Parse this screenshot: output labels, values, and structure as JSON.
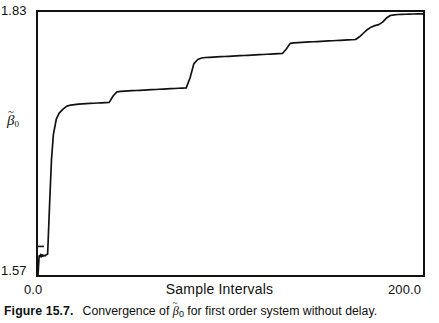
{
  "figure": {
    "caption_number": "Figure 15.7.",
    "caption_text_before": "Convergence of ",
    "caption_beta": "β",
    "caption_beta_tilde": "~",
    "caption_beta_sub": "0",
    "caption_text_after": " for first order system without delay."
  },
  "chart_data": {
    "type": "line",
    "title": "",
    "subtitle": "",
    "xlabel": "Sample Intervals",
    "ylabel": "β̃₀",
    "ylabel_base": "β",
    "ylabel_tilde": "~",
    "ylabel_sub": "0",
    "xlim": [
      0.0,
      200.0
    ],
    "ylim": [
      1.57,
      1.83
    ],
    "xticks": [
      0.0,
      200.0
    ],
    "xticklabels": [
      "0.0",
      "200.0"
    ],
    "yticks": [
      1.57,
      1.83
    ],
    "yticklabels": [
      "1.57",
      "1.83"
    ],
    "grid": false,
    "legend": null,
    "line_color": "#111111",
    "frame_color": "#111111",
    "background": "#ffffff",
    "annotations": [],
    "series": [
      {
        "name": "beta0_estimate",
        "x": [
          0.0,
          0.6,
          1.0,
          1.4,
          1.8,
          2.2,
          2.6,
          3.0,
          3.6,
          4.2,
          5.0,
          6.0,
          7.0,
          8.0,
          9.5,
          11.0,
          13.0,
          15.0,
          17.0,
          19.0,
          21.0,
          23.0,
          25.0,
          27.0,
          29.0,
          31.0,
          33.0,
          35.0,
          37.0,
          39.0,
          41.0,
          43.0,
          45.0,
          47.0,
          49.0,
          51.0,
          53.0,
          55.0,
          57.0,
          59.0,
          61.0,
          63.0,
          65.0,
          67.0,
          69.0,
          71.0,
          73.0,
          75.0,
          77.0,
          79.0,
          81.0,
          83.0,
          85.0,
          87.0,
          89.0,
          91.0,
          93.0,
          95.0,
          97.0,
          99.0,
          101.0,
          103.0,
          105.0,
          107.0,
          109.0,
          111.0,
          113.0,
          115.0,
          117.0,
          119.0,
          121.0,
          123.0,
          125.0,
          127.0,
          129.0,
          131.0,
          133.0,
          135.0,
          137.0,
          139.0,
          141.0,
          143.0,
          145.0,
          147.0,
          149.0,
          151.0,
          153.0,
          155.0,
          157.0,
          159.0,
          161.0,
          163.0,
          165.0,
          167.0,
          169.0,
          171.0,
          173.0,
          175.0,
          177.0,
          179.0,
          181.0,
          183.0,
          185.0,
          187.0,
          189.0,
          191.0,
          193.0,
          195.0,
          197.0,
          199.0,
          200.0
        ],
        "y": [
          1.57,
          1.589,
          1.588,
          1.5905,
          1.588,
          1.59,
          1.5885,
          1.5895,
          1.589,
          1.59,
          1.5905,
          1.639,
          1.684,
          1.709,
          1.724,
          1.73,
          1.734,
          1.737,
          1.738,
          1.7385,
          1.739,
          1.7392,
          1.7394,
          1.7396,
          1.7398,
          1.74,
          1.7402,
          1.7404,
          1.7406,
          1.747,
          1.751,
          1.7515,
          1.7518,
          1.752,
          1.7522,
          1.7524,
          1.7526,
          1.7528,
          1.753,
          1.7532,
          1.7534,
          1.7536,
          1.7538,
          1.754,
          1.7542,
          1.7544,
          1.7546,
          1.7548,
          1.755,
          1.765,
          1.779,
          1.783,
          1.7845,
          1.785,
          1.7852,
          1.7854,
          1.7856,
          1.7858,
          1.786,
          1.7862,
          1.7864,
          1.7866,
          1.7868,
          1.787,
          1.7872,
          1.7874,
          1.7876,
          1.7878,
          1.788,
          1.7882,
          1.7884,
          1.7886,
          1.7888,
          1.789,
          1.7935,
          1.799,
          1.7995,
          1.7998,
          1.8,
          1.8002,
          1.8004,
          1.8006,
          1.8008,
          1.801,
          1.8012,
          1.8014,
          1.8016,
          1.8018,
          1.802,
          1.8022,
          1.8024,
          1.8026,
          1.8028,
          1.8055,
          1.809,
          1.8125,
          1.815,
          1.8165,
          1.8175,
          1.82,
          1.824,
          1.8265,
          1.8272,
          1.8275,
          1.8277,
          1.8278,
          1.8279,
          1.828,
          1.8281,
          1.8282,
          1.8282
        ]
      }
    ]
  }
}
